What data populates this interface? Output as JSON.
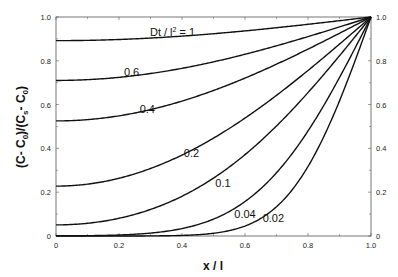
{
  "chart_data": {
    "type": "line",
    "title": "",
    "xlabel": "x / l",
    "ylabel": "(C - C0)/(Cs - C0)",
    "xlim": [
      0,
      1.0
    ],
    "ylim": [
      0,
      1.0
    ],
    "grid": false,
    "legend": "none (inline curve labels)",
    "x_ticks": [
      "0",
      "0.2",
      "0.4",
      "0.6",
      "0.8",
      "1.0"
    ],
    "y_ticks_left": [
      "0",
      "0.2",
      "0.4",
      "0.6",
      "0.8",
      "1.0"
    ],
    "y_ticks_right": [
      "0",
      "0.2",
      "0.4",
      "0.6",
      "0.8",
      "1.0"
    ],
    "x": [
      0,
      0.2,
      0.4,
      0.6,
      0.8,
      1.0
    ],
    "series": [
      {
        "name": "Dt / l² = 1",
        "T": 1.0,
        "label": "Dt / l² = 1",
        "values": [
          0.89,
          0.9,
          0.92,
          0.94,
          0.97,
          1.0
        ]
      },
      {
        "name": "0.6",
        "T": 0.6,
        "label": "0.6",
        "values": [
          0.71,
          0.72,
          0.76,
          0.82,
          0.91,
          1.0
        ]
      },
      {
        "name": "0.4",
        "T": 0.4,
        "label": "0.4",
        "values": [
          0.52,
          0.54,
          0.61,
          0.71,
          0.85,
          1.0
        ]
      },
      {
        "name": "0.2",
        "T": 0.2,
        "label": "0.2",
        "values": [
          0.23,
          0.26,
          0.36,
          0.51,
          0.73,
          1.0
        ]
      },
      {
        "name": "0.1",
        "T": 0.1,
        "label": "0.1",
        "values": [
          0.05,
          0.08,
          0.18,
          0.37,
          0.65,
          1.0
        ]
      },
      {
        "name": "0.04",
        "T": 0.04,
        "label": "0.04",
        "values": [
          0.0,
          0.0,
          0.03,
          0.16,
          0.48,
          1.0
        ]
      },
      {
        "name": "0.02",
        "T": 0.02,
        "label": "0.02",
        "values": [
          0.0,
          0.0,
          0.0,
          0.05,
          0.32,
          1.0
        ]
      }
    ],
    "annotations": [
      {
        "text": "Dt / l² = 1",
        "x": 0.37,
        "y": 0.93
      },
      {
        "text": "0.6",
        "x": 0.24,
        "y": 0.75
      },
      {
        "text": "0.4",
        "x": 0.29,
        "y": 0.58
      },
      {
        "text": "0.2",
        "x": 0.43,
        "y": 0.38
      },
      {
        "text": "0.1",
        "x": 0.53,
        "y": 0.24
      },
      {
        "text": "0.04",
        "x": 0.6,
        "y": 0.1
      },
      {
        "text": "0.02",
        "x": 0.69,
        "y": 0.08
      }
    ]
  },
  "labels": {
    "x_axis_title": "x / l",
    "y_axis_title_parts": [
      "(C- C",
      "0",
      ")/(C",
      "s",
      "- C",
      "0",
      ")"
    ],
    "top_label_prefix": "Dt / l",
    "top_label_sup": "2",
    "top_label_suffix": " = 1"
  }
}
